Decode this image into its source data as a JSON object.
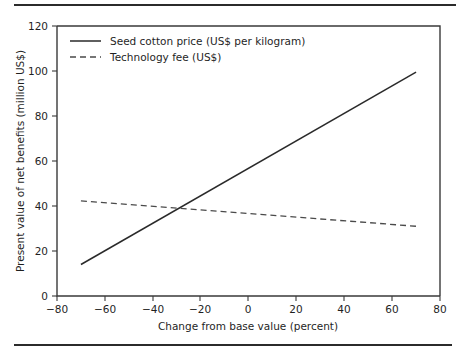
{
  "chart_data": {
    "type": "line",
    "title": "",
    "subtitle": "",
    "xlabel": "Change from base value (percent)",
    "ylabel": "Present value of net benefits (million US$)",
    "xlim": [
      -80,
      80
    ],
    "ylim": [
      0,
      120
    ],
    "xticks": [
      -80,
      -60,
      -40,
      -20,
      0,
      20,
      40,
      60,
      80
    ],
    "xtick_labels": [
      "−80",
      "−60",
      "−40",
      "−20",
      "0",
      "20",
      "40",
      "60",
      "80"
    ],
    "yticks": [
      0,
      20,
      40,
      60,
      80,
      100,
      120
    ],
    "ytick_labels": [
      "0",
      "20",
      "40",
      "60",
      "80",
      "100",
      "120"
    ],
    "grid": false,
    "legend_position": "top-left",
    "series": [
      {
        "name": "Seed cotton price (US$ per kilogram)",
        "style": "solid",
        "color": "#2a2a2a",
        "x": [
          -70,
          70
        ],
        "values": [
          14,
          99.5
        ]
      },
      {
        "name": "Technology fee (US$)",
        "style": "dashed",
        "color": "#4a4a4a",
        "x": [
          -70,
          70
        ],
        "values": [
          42.3,
          31
        ]
      }
    ],
    "annotations": []
  },
  "legend": {
    "entries": [
      {
        "label": "Seed cotton price (US$ per kilogram)"
      },
      {
        "label": "Technology fee (US$)"
      }
    ]
  },
  "axes": {
    "x_title": "Change from base value (percent)",
    "y_title": "Present value of net benefits (million US$)"
  }
}
